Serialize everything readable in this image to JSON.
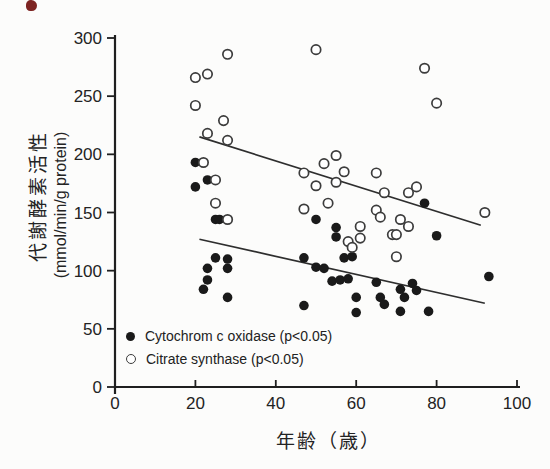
{
  "figure": {
    "background": "#fcfcfb",
    "ink_color": "#1f1f1f",
    "scan_artifact_color": "#7d2422"
  },
  "chart_data": {
    "type": "scatter",
    "title": "",
    "xlabel": "年齢（歳）",
    "ylabel": "代謝酵素活性",
    "ylabel_unit": "(mmol/min/g protein)",
    "xlim": [
      0,
      100
    ],
    "ylim": [
      0,
      300
    ],
    "x_ticks": [
      0,
      20,
      40,
      60,
      80,
      100
    ],
    "y_ticks": [
      0,
      50,
      100,
      150,
      200,
      250,
      300
    ],
    "grid": false,
    "legend_position": "inside-bottom-left",
    "series": [
      {
        "name": "Cytochrom c oxidase (p<0.05)",
        "marker": "filled-circle",
        "color": "#1a1a1a",
        "trend_line": {
          "x1": 21,
          "y1": 127,
          "x2": 92,
          "y2": 72
        },
        "points": [
          [
            20,
            193
          ],
          [
            23,
            178
          ],
          [
            20,
            172
          ],
          [
            25,
            144
          ],
          [
            26,
            144
          ],
          [
            25,
            111
          ],
          [
            28,
            110
          ],
          [
            23,
            102
          ],
          [
            28,
            102
          ],
          [
            23,
            92
          ],
          [
            22,
            84
          ],
          [
            28,
            77
          ],
          [
            50,
            144
          ],
          [
            55,
            137
          ],
          [
            55,
            129
          ],
          [
            47,
            111
          ],
          [
            57,
            111
          ],
          [
            59,
            112
          ],
          [
            50,
            103
          ],
          [
            52,
            102
          ],
          [
            54,
            91
          ],
          [
            56,
            92
          ],
          [
            58,
            93
          ],
          [
            60,
            77
          ],
          [
            47,
            70
          ],
          [
            60,
            64
          ],
          [
            65,
            90
          ],
          [
            66,
            77
          ],
          [
            67,
            71
          ],
          [
            77,
            158
          ],
          [
            80,
            130
          ],
          [
            74,
            89
          ],
          [
            71,
            84
          ],
          [
            75,
            83
          ],
          [
            72,
            77
          ],
          [
            71,
            65
          ],
          [
            78,
            65
          ],
          [
            93,
            95
          ]
        ]
      },
      {
        "name": "Citrate synthase (p<0.05)",
        "marker": "open-circle",
        "color": "#3c3c3c",
        "trend_line": {
          "x1": 21,
          "y1": 215,
          "x2": 91,
          "y2": 139
        },
        "points": [
          [
            28,
            286
          ],
          [
            23,
            269
          ],
          [
            20,
            266
          ],
          [
            20,
            242
          ],
          [
            27,
            229
          ],
          [
            23,
            218
          ],
          [
            28,
            212
          ],
          [
            22,
            193
          ],
          [
            25,
            178
          ],
          [
            25,
            158
          ],
          [
            28,
            144
          ],
          [
            50,
            290
          ],
          [
            55,
            199
          ],
          [
            52,
            192
          ],
          [
            57,
            185
          ],
          [
            47,
            184
          ],
          [
            55,
            176
          ],
          [
            50,
            173
          ],
          [
            53,
            158
          ],
          [
            47,
            153
          ],
          [
            61,
            138
          ],
          [
            61,
            128
          ],
          [
            58,
            125
          ],
          [
            59,
            120
          ],
          [
            77,
            274
          ],
          [
            80,
            244
          ],
          [
            65,
            184
          ],
          [
            67,
            167
          ],
          [
            73,
            167
          ],
          [
            75,
            172
          ],
          [
            65,
            152
          ],
          [
            66,
            146
          ],
          [
            71,
            144
          ],
          [
            73,
            138
          ],
          [
            69,
            131
          ],
          [
            70,
            131
          ],
          [
            70,
            112
          ],
          [
            92,
            150
          ]
        ]
      }
    ]
  }
}
